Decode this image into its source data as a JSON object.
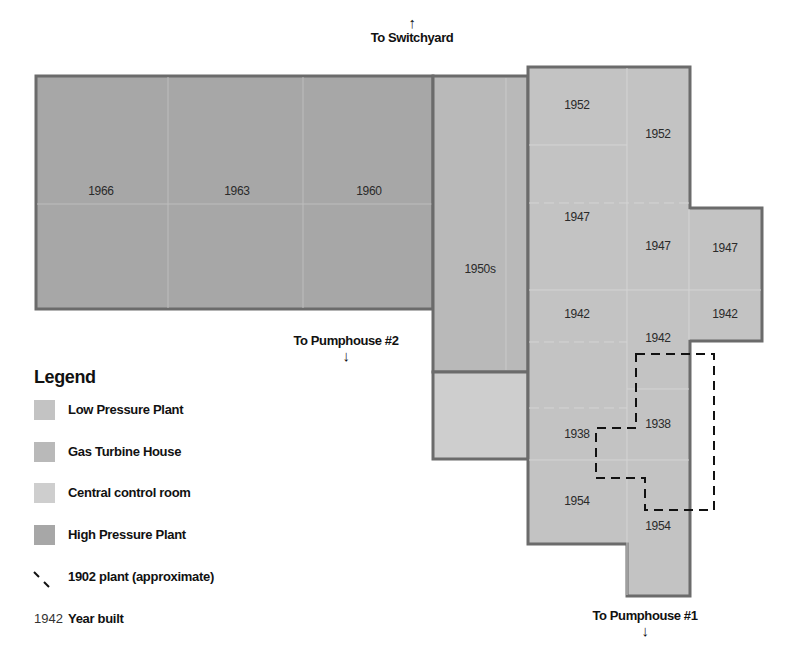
{
  "directions": {
    "north": {
      "label": "To Switchyard",
      "arrow": "↑"
    },
    "pumphouse2": {
      "label": "To Pumphouse #2",
      "arrow": "↓"
    },
    "pumphouse1": {
      "label": "To Pumphouse #1",
      "arrow": "↓"
    }
  },
  "colors": {
    "low_pressure": "#c3c3c3",
    "gas_turbine": "#b9b9b9",
    "control_room": "#cecece",
    "high_pressure": "#a7a7a7",
    "outline": "#6b6b6b",
    "dashed": "#111111"
  },
  "buildings": {
    "high_pressure": {
      "name": "High Pressure Plant",
      "sections": [
        {
          "year": "1966",
          "x": 101,
          "y": 191
        },
        {
          "year": "1963",
          "x": 237,
          "y": 191
        },
        {
          "year": "1960",
          "x": 369,
          "y": 191
        }
      ]
    },
    "gas_turbine": {
      "name": "Gas Turbine House",
      "sections": [
        {
          "year": "1950s",
          "x": 480,
          "y": 269
        }
      ]
    },
    "control_room": {
      "name": "Central control room",
      "sections": []
    },
    "low_pressure": {
      "name": "Low Pressure Plant",
      "sections": [
        {
          "year": "1952",
          "x": 577,
          "y": 105
        },
        {
          "year": "1952",
          "x": 658,
          "y": 134
        },
        {
          "year": "1947",
          "x": 577,
          "y": 217
        },
        {
          "year": "1947",
          "x": 658,
          "y": 246
        },
        {
          "year": "1947",
          "x": 725,
          "y": 248
        },
        {
          "year": "1942",
          "x": 577,
          "y": 314
        },
        {
          "year": "1942",
          "x": 658,
          "y": 338
        },
        {
          "year": "1942",
          "x": 725,
          "y": 314
        },
        {
          "year": "1938",
          "x": 577,
          "y": 434
        },
        {
          "year": "1938",
          "x": 658,
          "y": 424
        },
        {
          "year": "1954",
          "x": 577,
          "y": 501
        },
        {
          "year": "1954",
          "x": 658,
          "y": 526
        }
      ]
    }
  },
  "legend": {
    "title": "Legend",
    "items": [
      {
        "label": "Low Pressure Plant",
        "swatch": "#c3c3c3"
      },
      {
        "label": "Gas Turbine House",
        "swatch": "#b9b9b9"
      },
      {
        "label": "Central control room",
        "swatch": "#cecece"
      },
      {
        "label": "High Pressure Plant",
        "swatch": "#a7a7a7"
      },
      {
        "label": "1902 plant (approximate)",
        "symbol": "dashed-line"
      },
      {
        "label": "Year built",
        "symbol_text": "1942"
      }
    ]
  }
}
